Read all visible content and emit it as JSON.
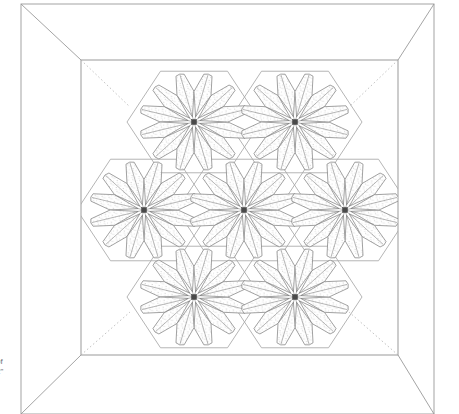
{
  "diagram": {
    "type": "quilt-pattern-line-drawing",
    "canvas": {
      "width": 459,
      "height": 414
    },
    "colors": {
      "background": "#ffffff",
      "line": "#8b8b8b",
      "line_dark": "#6a6a6a",
      "hexagon_outline": "#a8a8a8",
      "petal_outline": "#7a7a7a",
      "petal_fill": "#fcfcfc",
      "stipple_dot": "#b9b9b9",
      "center_hub": "#4a4a4a",
      "dashed_line": "#b0b0b0",
      "caption_text": "#6e6e6e"
    },
    "border": {
      "name": "mitered-outer-border",
      "outer_rect": {
        "x": 21,
        "y": 4,
        "width": 413,
        "height": 410
      },
      "inner_rect": {
        "x": 81,
        "y": 60,
        "width": 317,
        "height": 295
      },
      "miter_corners": 4,
      "style": "solid"
    },
    "inner_field": {
      "name": "quilt-center-field",
      "dashed_corner_guides": 4,
      "dashed_style": "dotted"
    },
    "hexagon_grid": {
      "layout": "honeycomb",
      "orientation": "flat-top",
      "count": 7,
      "rows": [
        {
          "row": "top",
          "count": 2
        },
        {
          "row": "middle",
          "count": 3
        },
        {
          "row": "bottom",
          "count": 2
        }
      ],
      "radius": 67,
      "cells": [
        {
          "id": "hex-top-left",
          "cx": 194,
          "cy": 122,
          "flower": "flower-1"
        },
        {
          "id": "hex-top-right",
          "cx": 295,
          "cy": 122,
          "flower": "flower-2"
        },
        {
          "id": "hex-mid-left",
          "cx": 144,
          "cy": 210,
          "flower": "flower-3"
        },
        {
          "id": "hex-mid-center",
          "cx": 244,
          "cy": 210,
          "flower": "flower-4"
        },
        {
          "id": "hex-mid-right",
          "cx": 345,
          "cy": 210,
          "flower": "flower-5"
        },
        {
          "id": "hex-bottom-left",
          "cx": 194,
          "cy": 297,
          "flower": "flower-6"
        },
        {
          "id": "hex-bottom-right",
          "cx": 295,
          "cy": 297,
          "flower": "flower-7"
        }
      ]
    },
    "flower_motif": {
      "name": "dresden-plate-flower",
      "petal_count": 12,
      "petal_outer_radius": 54,
      "petal_inner_radius": 6,
      "petal_mid_radius": 34,
      "petal_half_angle_deg": 15,
      "fill_texture": "stipple-dots",
      "center_hub": {
        "shape": "square",
        "size": 5
      }
    },
    "caption": {
      "lines": [
        "of",
        "2\""
      ],
      "clipped": true,
      "position": "bottom-left"
    }
  }
}
